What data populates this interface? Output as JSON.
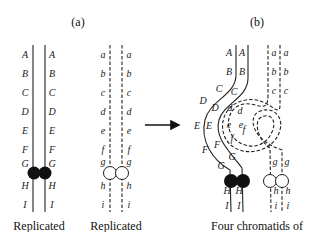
{
  "panels": {
    "a": {
      "label": "(a)"
    },
    "b": {
      "label": "(b)"
    }
  },
  "chromosome_labels": {
    "upper": [
      "A",
      "B",
      "C",
      "D",
      "E",
      "F",
      "G",
      "H",
      "I"
    ],
    "lower": [
      "a",
      "b",
      "c",
      "d",
      "e",
      "f",
      "g",
      "h",
      "i"
    ]
  },
  "captions": {
    "left": "Replicated",
    "middle": "Replicated",
    "right": "Four chromatids of"
  },
  "colors": {
    "line": "#222222",
    "centromere_filled": "#111111",
    "centromere_open": "#ffffff",
    "background": "#ffffff"
  }
}
